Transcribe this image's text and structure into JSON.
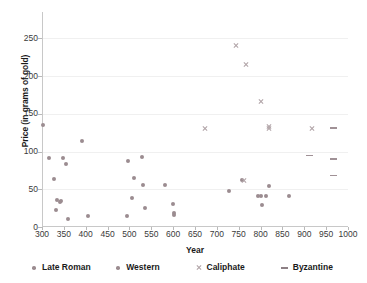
{
  "chart_data": {
    "type": "scatter",
    "title": "",
    "xlabel": "Year",
    "ylabel": "Price (in grams of gold)",
    "xlim": [
      300,
      1000
    ],
    "ylim": [
      0,
      285
    ],
    "xticks": [
      300,
      350,
      400,
      450,
      500,
      550,
      600,
      650,
      700,
      750,
      800,
      850,
      900,
      950,
      1000
    ],
    "yticks": [
      0,
      50,
      100,
      150,
      200,
      250
    ],
    "grid": "horizontal-faint",
    "legend_position": "bottom",
    "series": [
      {
        "name": "Late Roman",
        "marker": "dot",
        "color": "#9b8c90",
        "points": [
          [
            302,
            135
          ],
          [
            317,
            91
          ],
          [
            327,
            64
          ],
          [
            334,
            36
          ],
          [
            333,
            22
          ],
          [
            341,
            33
          ],
          [
            343,
            34
          ],
          [
            347,
            92
          ],
          [
            355,
            83
          ],
          [
            360,
            10
          ],
          [
            392,
            114
          ],
          [
            406,
            14
          ]
        ]
      },
      {
        "name": "Western",
        "marker": "dot",
        "color": "#9b8c90",
        "points": [
          [
            494,
            15
          ],
          [
            497,
            87
          ],
          [
            506,
            38
          ],
          [
            510,
            65
          ],
          [
            528,
            93
          ],
          [
            530,
            56
          ],
          [
            535,
            25
          ],
          [
            582,
            56
          ],
          [
            600,
            30
          ],
          [
            601,
            19
          ],
          [
            601,
            16
          ],
          [
            727,
            48
          ],
          [
            757,
            62
          ],
          [
            795,
            41
          ],
          [
            800,
            41
          ],
          [
            803,
            29
          ],
          [
            812,
            41
          ],
          [
            820,
            54
          ],
          [
            866,
            41
          ]
        ]
      },
      {
        "name": "Caliphate",
        "marker": "x",
        "color": "#b0a3a7",
        "points": [
          [
            674,
            131
          ],
          [
            744,
            241
          ],
          [
            767,
            216
          ],
          [
            762,
            62
          ],
          [
            800,
            166
          ],
          [
            820,
            133
          ],
          [
            820,
            131
          ],
          [
            917,
            131
          ]
        ]
      },
      {
        "name": "Byzantine",
        "marker": "dash",
        "color": "#8d8085",
        "points": [
          [
            911,
            95
          ],
          [
            967,
            131
          ],
          [
            967,
            90
          ],
          [
            967,
            68
          ]
        ]
      }
    ]
  },
  "legend": {
    "items": [
      {
        "label": "Late Roman",
        "marker": "dot"
      },
      {
        "label": "Western",
        "marker": "dot"
      },
      {
        "label": "Caliphate",
        "marker": "x"
      },
      {
        "label": "Byzantine",
        "marker": "dash"
      }
    ]
  }
}
